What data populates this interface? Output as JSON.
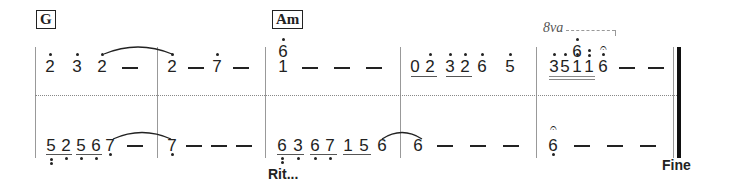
{
  "score": {
    "chords": [
      {
        "label": "G",
        "measure": 1
      },
      {
        "label": "Am",
        "measure": 3
      }
    ],
    "ottava": {
      "label": "8va",
      "measure": 5
    },
    "directions": {
      "ritardando": "Rit...",
      "fine": "Fine"
    },
    "upper_staff": {
      "measures": [
        {
          "notes": [
            "2̇",
            "3̇",
            "2̇",
            "—"
          ],
          "tie_from_note": 3
        },
        {
          "notes": [
            "2̇",
            "—",
            "7̇",
            "—"
          ],
          "tie_to_note": 1
        },
        {
          "notes": [
            "1 / 6̇",
            "—",
            "—",
            "—"
          ]
        },
        {
          "notes": [
            "0",
            "2̇",
            "3̇",
            "2̇",
            "6̇",
            "5̇"
          ],
          "underlined_groups": [
            [
              "0",
              "2̇"
            ],
            [
              "3̇",
              "2̇"
            ]
          ]
        },
        {
          "notes": [
            "3̇",
            "5̇",
            "1̈ / 6̇",
            "1̈",
            "6̇ (fermata)",
            "—",
            "—"
          ],
          "double_underline": [
            "3̇",
            "5̇",
            "1̈",
            "1̈"
          ]
        }
      ]
    },
    "lower_staff": {
      "measures": [
        {
          "notes": [
            "5̤",
            "2̣",
            "5̣",
            "6̣",
            "7̣",
            "—"
          ],
          "underlined_groups": [
            [
              "5̤",
              "2̣"
            ],
            [
              "5̣",
              "6̣"
            ]
          ],
          "tie_from_note": 5
        },
        {
          "notes": [
            "7̣",
            "—",
            "—",
            "—"
          ],
          "tie_to_note": 1
        },
        {
          "notes": [
            "6̤",
            "3̣",
            "6̣",
            "7̣",
            "1",
            "5",
            "6"
          ],
          "underlined_groups": [
            [
              "6̤",
              "3̣"
            ],
            [
              "6̣",
              "7̣"
            ],
            [
              "1",
              "5"
            ]
          ],
          "tie_from_note": 7
        },
        {
          "notes": [
            "6",
            "—",
            "—",
            "—"
          ],
          "tie_to_note": 1
        },
        {
          "notes": [
            "6̣ (fermata)",
            "—",
            "—",
            "—"
          ]
        }
      ]
    },
    "glyphs": {
      "g_u1": "2",
      "g_u2": "3",
      "g_u3": "2",
      "g_u4": "2",
      "g_u5": "7",
      "g_u6": "6",
      "g_u7": "1",
      "g_u8": "0",
      "g_u9": "2",
      "g_u10": "3",
      "g_u11": "2",
      "g_u12": "6",
      "g_u13": "5",
      "g_u14": "3",
      "g_u15": "5",
      "g_u16": "6",
      "g_u17": "1",
      "g_u18": "1",
      "g_u19": "6",
      "g_l1": "5",
      "g_l2": "2",
      "g_l3": "5",
      "g_l4": "6",
      "g_l5": "7",
      "g_l6": "7",
      "g_l7": "6",
      "g_l8": "3",
      "g_l9": "6",
      "g_l10": "7",
      "g_l11": "1",
      "g_l12": "5",
      "g_l13": "6",
      "g_l14": "6",
      "g_l15": "6",
      "fermata": "𝄐"
    }
  }
}
